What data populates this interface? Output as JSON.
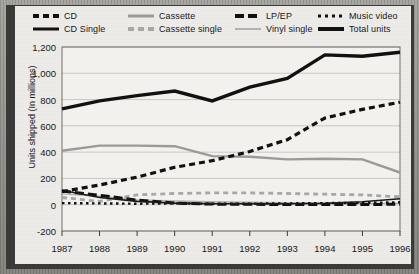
{
  "chart_data": {
    "type": "line",
    "title": "",
    "xlabel": "",
    "ylabel": "Units shipped (In millions)",
    "categories": [
      "1987",
      "1988",
      "1989",
      "1990",
      "1991",
      "1992",
      "1993",
      "1994",
      "1995",
      "1996"
    ],
    "x": [
      1987,
      1988,
      1989,
      1990,
      1991,
      1992,
      1993,
      1994,
      1995,
      1996
    ],
    "ylim": [
      -200,
      1200
    ],
    "yticks": [
      "-200",
      "0",
      "200",
      "400",
      "600",
      "800",
      "1,000",
      "1,200"
    ],
    "ytick_values": [
      -200,
      0,
      200,
      400,
      600,
      800,
      1000,
      1200
    ],
    "grid": true,
    "legend_position": "top",
    "series": [
      {
        "name": "CD",
        "style": "dashed-black",
        "color": "#111111",
        "values": [
          100,
          150,
          210,
          285,
          335,
          405,
          495,
          660,
          725,
          780
        ]
      },
      {
        "name": "CD Single",
        "style": "solid-black",
        "color": "#111111",
        "values": [
          110,
          55,
          25,
          12,
          8,
          8,
          8,
          10,
          22,
          45
        ]
      },
      {
        "name": "Cassette",
        "style": "solid-gray",
        "color": "#9a9a99",
        "values": [
          410,
          450,
          450,
          445,
          370,
          365,
          345,
          350,
          345,
          245
        ]
      },
      {
        "name": "Cassette single",
        "style": "dashed-gray",
        "color": "#a7a7a5",
        "values": [
          55,
          25,
          75,
          85,
          90,
          90,
          85,
          80,
          75,
          60
        ]
      },
      {
        "name": "LP/EP",
        "style": "dashed-black-wide",
        "color": "#111111",
        "values": [
          105,
          72,
          35,
          12,
          5,
          3,
          2,
          2,
          2,
          3
        ]
      },
      {
        "name": "Vinyl single",
        "style": "solid-gray-thin",
        "color": "#b1b1af",
        "values": [
          82,
          65,
          36,
          28,
          22,
          19,
          15,
          12,
          10,
          10
        ]
      },
      {
        "name": "Music video",
        "style": "dotted-black",
        "color": "#111111",
        "values": [
          12,
          10,
          8,
          10,
          8,
          8,
          10,
          12,
          14,
          18
        ]
      },
      {
        "name": "Total units",
        "style": "solid-thick-black",
        "color": "#111111",
        "values": [
          730,
          790,
          830,
          865,
          790,
          895,
          960,
          1140,
          1130,
          1160
        ]
      }
    ]
  },
  "legend": {
    "row1": [
      {
        "label": "CD",
        "swatch": "sw-dash-black"
      },
      {
        "label": "Cassette",
        "swatch": "sw-solid-gray"
      },
      {
        "label": "LP/EP",
        "swatch": "sw-dash-black-wide"
      },
      {
        "label": "Music video",
        "swatch": "sw-dot-black"
      }
    ],
    "row2": [
      {
        "label": "CD Single",
        "swatch": "sw-solid-black"
      },
      {
        "label": "Cassette single",
        "swatch": "sw-dash-gray"
      },
      {
        "label": "Vinyl single",
        "swatch": "sw-solid-gray-thin"
      },
      {
        "label": "Total units",
        "swatch": "sw-solid-thick"
      }
    ]
  },
  "axis": {
    "y_title": "Units shipped (In millions)"
  },
  "colors": {
    "ink": "#111111",
    "gray_series": "#9a9a99",
    "paper": "#edece8",
    "frame": "#3a3a38",
    "grid": "#bdbdba"
  }
}
